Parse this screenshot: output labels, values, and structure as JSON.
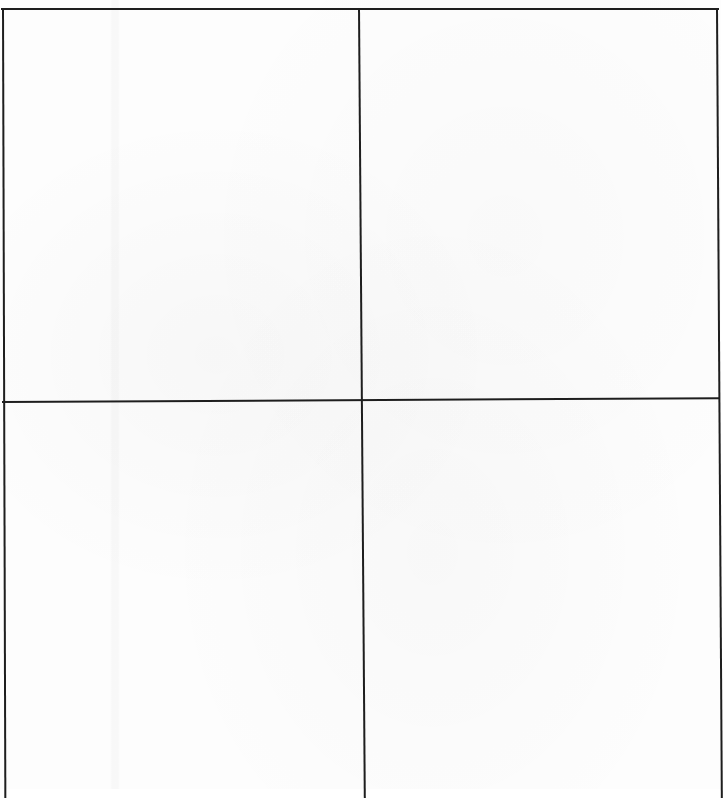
{
  "document": {
    "type": "scanned-page",
    "layout": "2x2-ruled-grid",
    "cells": [
      {
        "position": "top-left",
        "content": ""
      },
      {
        "position": "top-right",
        "content": ""
      },
      {
        "position": "bottom-left",
        "content": ""
      },
      {
        "position": "bottom-right",
        "content": ""
      }
    ]
  },
  "colors": {
    "paper": "#fdfdfd",
    "rule_line": "#1e1e1e"
  }
}
